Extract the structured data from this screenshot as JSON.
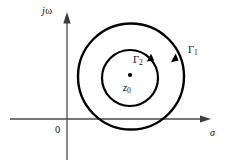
{
  "figure": {
    "background_color": "#ffffff",
    "axis_color": "#4a4a4a",
    "contour_color": "#000000",
    "point_color": "#000000",
    "label_color": "#111111"
  },
  "axes": {
    "vertical": {
      "label_prefix": "j",
      "label_symbol": "ω",
      "full_label": "jω",
      "name": "imaginary-axis",
      "x": 67,
      "top": 14,
      "bottom": 160
    },
    "horizontal": {
      "label_symbol": "σ",
      "full_label": "σ",
      "name": "real-axis",
      "y": 119,
      "left": 10,
      "right": 208
    },
    "origin": {
      "label": "0",
      "x": 67,
      "y": 119
    }
  },
  "contours": [
    {
      "id": "gamma-1",
      "label_base": "Γ",
      "label_sub": "1",
      "full_label": "Γ1",
      "cx": 131,
      "cy": 76.5,
      "r": 53,
      "stroke_width": 2.4,
      "arrow_angle_deg": -35,
      "direction": "counterclockwise"
    },
    {
      "id": "gamma-2",
      "label_base": "Γ",
      "label_sub": "2",
      "full_label": "Γ2",
      "cx": 130,
      "cy": 78,
      "r": 28,
      "stroke_width": 2.2,
      "arrow_angle_deg": -50,
      "direction": "counterclockwise"
    }
  ],
  "points": [
    {
      "id": "z-zero",
      "label_base": "z",
      "label_sub": "0",
      "full_label": "z0",
      "x": 130,
      "y": 75,
      "radius": 2.1
    }
  ]
}
